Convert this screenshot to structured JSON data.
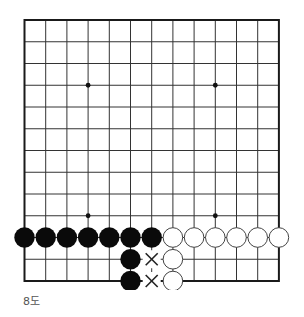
{
  "diagram": {
    "caption": "8도",
    "board": {
      "columns": 13,
      "rows": 13,
      "origin_x": 24.5,
      "origin_y": 20,
      "spacing_x": 21.2,
      "spacing_y": 21.75,
      "line_color": "#333333",
      "border_color": "#1a1a1a",
      "star_points": [
        [
          3,
          3
        ],
        [
          9,
          3
        ],
        [
          3,
          9
        ],
        [
          9,
          9
        ]
      ]
    },
    "stones": {
      "black": [
        [
          0,
          10
        ],
        [
          1,
          10
        ],
        [
          2,
          10
        ],
        [
          3,
          10
        ],
        [
          4,
          10
        ],
        [
          5,
          10
        ],
        [
          6,
          10
        ],
        [
          5,
          11
        ],
        [
          5,
          12
        ]
      ],
      "white": [
        [
          7,
          10
        ],
        [
          8,
          10
        ],
        [
          9,
          10
        ],
        [
          10,
          10
        ],
        [
          11,
          10
        ],
        [
          12,
          10
        ],
        [
          7,
          11
        ],
        [
          7,
          12
        ]
      ]
    },
    "marks": [
      {
        "type": "x",
        "col": 6,
        "row": 11
      },
      {
        "type": "x",
        "col": 6,
        "row": 12
      }
    ],
    "colors": {
      "black_stone": "#0a0a0a",
      "white_stone": "#ffffff",
      "white_stone_outline": "#444444",
      "mark": "#222222"
    }
  }
}
